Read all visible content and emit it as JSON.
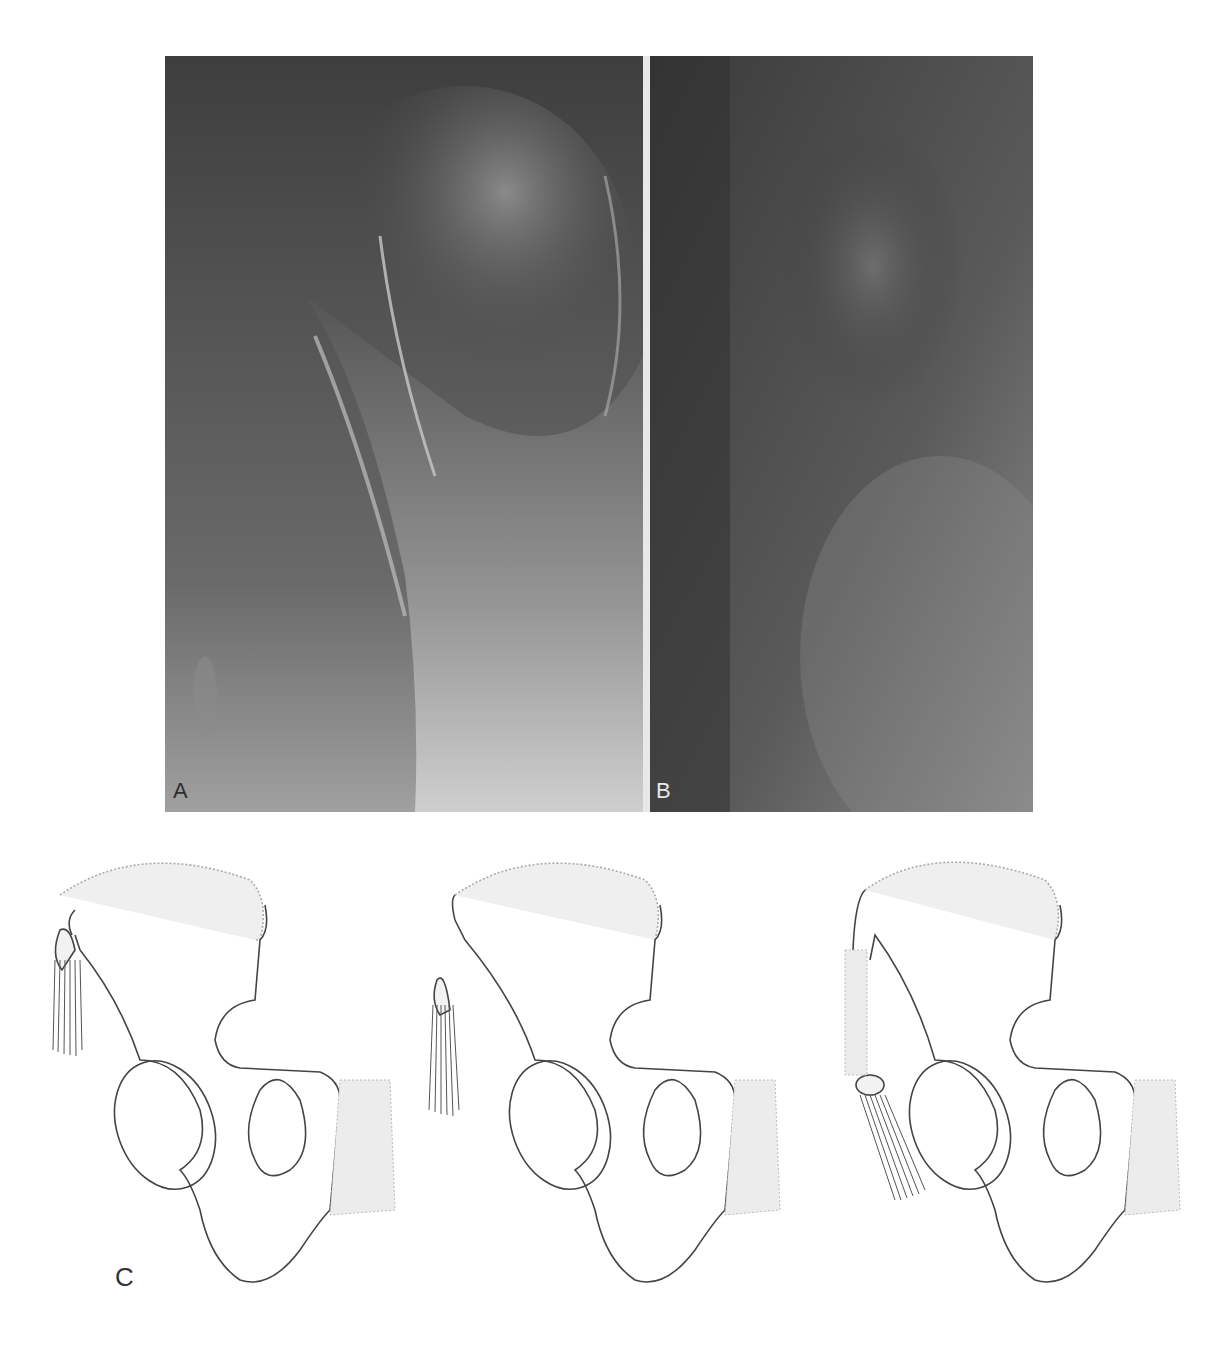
{
  "figure": {
    "panels": [
      {
        "id": "A",
        "label": "A",
        "type": "radiograph",
        "description": "X-ray of pelvis/hip region showing bony outline, lighter bone density on right side"
      },
      {
        "id": "B",
        "label": "B",
        "type": "radiograph",
        "description": "X-ray of pelvis/hip region, darker exposure"
      },
      {
        "id": "C",
        "label": "C",
        "type": "line-drawings",
        "count": 3,
        "description": "Three schematic line drawings of hemipelvis showing progressive displacement of anterior superior iliac spine avulsion fragment with attached muscle fibers; stippled areas indicate cartilage/apophyses"
      }
    ],
    "colors": {
      "background": "#ffffff",
      "radiograph_dark": "#3c3c3c",
      "radiograph_light": "#d8d8d8",
      "line_stroke": "#444444",
      "stipple": "#9a9a9a"
    }
  }
}
